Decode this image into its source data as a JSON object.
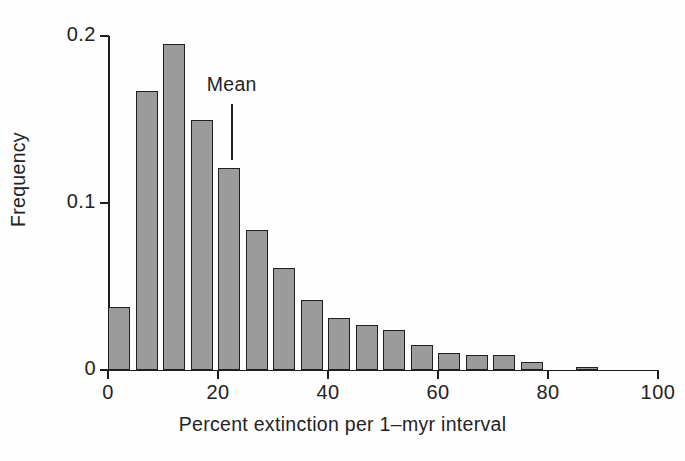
{
  "figure": {
    "background_color": "#fefefe",
    "bar_fill_color": "#9b9b9b",
    "bar_edge_color": "#1f1f1f",
    "axis_color": "#1d1d1d"
  },
  "chart_data": {
    "type": "bar",
    "title": "",
    "subtitle": "",
    "xlabel": "Percent extinction per 1–myr interval",
    "ylabel": "Frequency",
    "xlim": [
      0,
      100
    ],
    "ylim": [
      0,
      0.2
    ],
    "grid": false,
    "legend": null,
    "bin_width": 5,
    "xticks": [
      0,
      20,
      40,
      60,
      80,
      100
    ],
    "xtick_labels": [
      "0",
      "20",
      "40",
      "60",
      "80",
      "100"
    ],
    "yticks": [
      0,
      0.1,
      0.2
    ],
    "ytick_labels": [
      "0",
      "0.1",
      "0.2"
    ],
    "bin_starts": [
      0,
      5,
      10,
      15,
      20,
      25,
      30,
      35,
      40,
      45,
      50,
      55,
      60,
      65,
      70,
      75,
      85
    ],
    "bin_ends": [
      4,
      9,
      14,
      19,
      24,
      29,
      34,
      39,
      44,
      49,
      54,
      59,
      64,
      69,
      74,
      79,
      89
    ],
    "categories": [
      "0–5",
      "5–10",
      "10–15",
      "15–20",
      "20–25",
      "25–30",
      "30–35",
      "35–40",
      "40–45",
      "45–50",
      "50–55",
      "55–60",
      "60–65",
      "65–70",
      "70–75",
      "75–80",
      "85–90"
    ],
    "values": [
      0.038,
      0.167,
      0.195,
      0.15,
      0.121,
      0.084,
      0.061,
      0.042,
      0.031,
      0.027,
      0.024,
      0.015,
      0.01,
      0.009,
      0.009,
      0.005,
      0.002
    ],
    "annotations": [
      {
        "name": "mean",
        "label": "Mean",
        "x": 22.5,
        "line_top_value": 0.159,
        "line_bottom_value": 0.126
      }
    ]
  }
}
